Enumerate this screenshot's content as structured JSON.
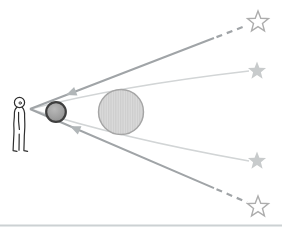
{
  "diagram": {
    "kind": "light-deflection-illustration",
    "observer": "standing-person",
    "bodies": [
      "dark-sphere",
      "hatched-sun-disk"
    ],
    "star_glyphs": {
      "apparent_star": "☆",
      "true_star": "★"
    },
    "ray_counts": {
      "apparent_sightlines": 2,
      "deflected_light_rays": 2,
      "arrowheads": 2
    }
  },
  "colors": {
    "background": "#ffffff",
    "sightline": "#a0a4a7",
    "light_path": "#d2d5d6",
    "arrowhead": "#b1b6b8",
    "sun_fill": "#dbdbdb",
    "sun_hatch": "#c3c3c3",
    "sun_rim": "#a5a5a5",
    "moon_rim": "#3e3e3e",
    "moon_center": "#b9b9b9",
    "moon_mid": "#a0a0a0",
    "moon_edge": "#8a8a8a",
    "star_outline_stroke": "#adadad",
    "star_outline_fill": "#ffffff",
    "star_faint_fill": "#c8cbcc",
    "person_stroke": "#2e2e2e",
    "person_fill": "#ffffff",
    "baseline": "#ccd1d3"
  }
}
